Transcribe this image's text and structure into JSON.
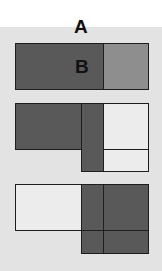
{
  "labels": {
    "a": "A",
    "b": "B"
  },
  "colors": {
    "background": "#e3e3e3",
    "dark_fill": "#595959",
    "light_fill": "#8e8e8e",
    "empty_fill": "#ececec",
    "stroke": "#1e1e1e"
  },
  "panels": [
    {
      "name": "panel-1",
      "description": "Rectangle A split into dark region B and lighter remainder"
    },
    {
      "name": "panel-2",
      "description": "Dark region B with overlapping vertical strip extending below, white remainder"
    },
    {
      "name": "panel-3",
      "description": "White left rectangle, dark overlapping square region on right extending below"
    }
  ]
}
